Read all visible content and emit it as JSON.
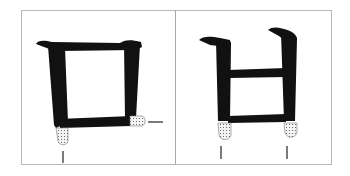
{
  "diagram": {
    "type": "calligraphy-stroke-guide",
    "panels": [
      {
        "id": "left",
        "glyph": "ㅁ",
        "description": "Square-shaped glyph with dotted highlights at the bottom-left stroke end and right-bottom corner",
        "highlights": [
          "bottom-left stroke tip",
          "bottom-right corner tip"
        ],
        "guide_marks": [
          "vertical tick below left stroke",
          "horizontal dash right of bottom corner"
        ]
      },
      {
        "id": "right",
        "glyph": "ㅂ",
        "description": "Glyph with two vertical strokes, a middle and bottom horizontal, with dotted highlights at both stroke bottoms",
        "highlights": [
          "bottom of left vertical stroke",
          "bottom of right vertical stroke"
        ],
        "guide_marks": [
          "vertical tick below left stroke",
          "vertical tick below right stroke"
        ]
      }
    ],
    "colors": {
      "ink": "#111111",
      "frame": "#b8b8b8",
      "highlight_fill": "#f2f2f2",
      "highlight_dots": "#555555"
    }
  }
}
